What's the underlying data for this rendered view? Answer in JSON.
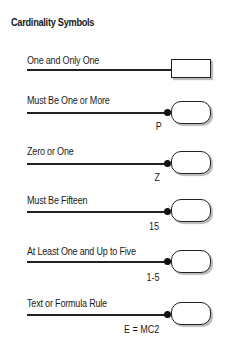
{
  "title": "Cardinality Symbols",
  "rows": [
    {
      "label": "One and Only One",
      "symbol": "rectangle",
      "annotation": ""
    },
    {
      "label": "Must Be One or More",
      "symbol": "dot-rounded-box",
      "annotation": "P"
    },
    {
      "label": "Zero or One",
      "symbol": "dot-rounded-box",
      "annotation": "Z"
    },
    {
      "label": "Must Be Fifteen",
      "symbol": "dot-rounded-box",
      "annotation": "15"
    },
    {
      "label": "At Least One and Up to Five",
      "symbol": "dot-rounded-box",
      "annotation": "1-5"
    },
    {
      "label": "Text or Formula Rule",
      "symbol": "dot-rounded-box",
      "annotation": "E = MC2"
    }
  ]
}
